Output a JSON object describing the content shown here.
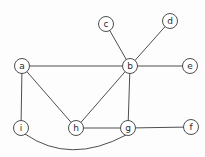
{
  "diagram": {
    "type": "undirected-graph",
    "colors": {
      "stroke": "#3a3a3a",
      "node_fill": "#ffffff",
      "label": "#2a2a2a"
    },
    "node_radius": 7.5,
    "nodes": [
      {
        "id": "a",
        "label": "a",
        "x": 22,
        "y": 66
      },
      {
        "id": "b",
        "label": "b",
        "x": 130,
        "y": 66
      },
      {
        "id": "c",
        "label": "c",
        "x": 106,
        "y": 24
      },
      {
        "id": "d",
        "label": "d",
        "x": 170,
        "y": 21
      },
      {
        "id": "e",
        "label": "e",
        "x": 190,
        "y": 66
      },
      {
        "id": "i",
        "label": "i",
        "x": 21,
        "y": 128
      },
      {
        "id": "h",
        "label": "h",
        "x": 76,
        "y": 128
      },
      {
        "id": "g",
        "label": "g",
        "x": 128,
        "y": 128
      },
      {
        "id": "f",
        "label": "f",
        "x": 191,
        "y": 127
      }
    ],
    "edges": [
      {
        "from": "a",
        "to": "b"
      },
      {
        "from": "a",
        "to": "h"
      },
      {
        "from": "a",
        "to": "i"
      },
      {
        "from": "b",
        "to": "c"
      },
      {
        "from": "b",
        "to": "d"
      },
      {
        "from": "b",
        "to": "e"
      },
      {
        "from": "b",
        "to": "h"
      },
      {
        "from": "b",
        "to": "g"
      },
      {
        "from": "h",
        "to": "g"
      },
      {
        "from": "g",
        "to": "f"
      },
      {
        "from": "i",
        "to": "g",
        "curved": true,
        "control": {
          "x": 70,
          "y": 165
        }
      }
    ]
  }
}
